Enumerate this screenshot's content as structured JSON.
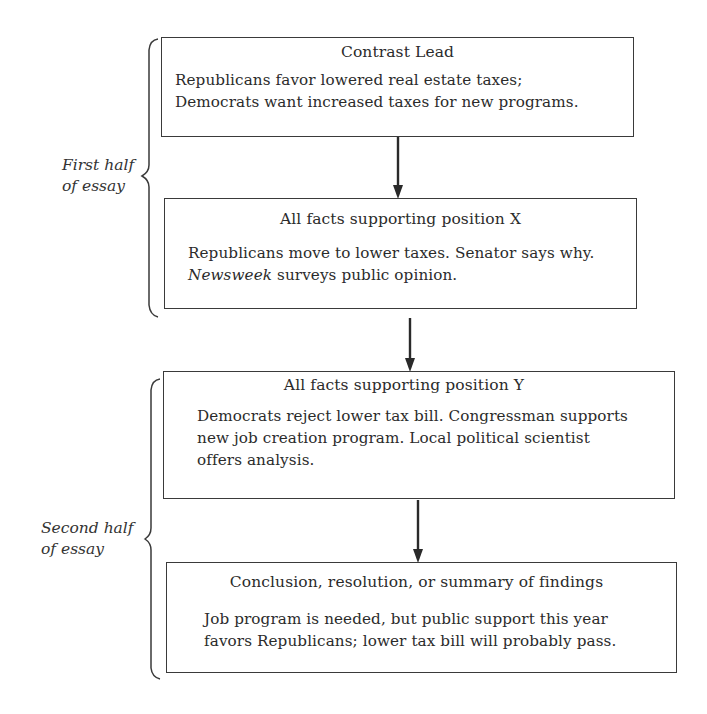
{
  "diagram": {
    "type": "essay-structure-flowchart",
    "sections": [
      {
        "label_line1": "First half",
        "label_line2": "of essay"
      },
      {
        "label_line1": "Second half",
        "label_line2": "of essay"
      }
    ],
    "boxes": [
      {
        "title": "Contrast Lead",
        "body_lines": [
          "Republicans favor lowered real estate taxes;",
          "Democrats want increased taxes for new programs."
        ]
      },
      {
        "title": "All facts supporting position X",
        "body_line1": "Republicans move to lower taxes.  Senator says why.",
        "body_line2_italic": "Newsweek",
        "body_line2_rest": " surveys public opinion."
      },
      {
        "title": "All facts supporting position Y",
        "body_lines": [
          "Democrats reject lower tax bill.  Congressman supports",
          "new job creation program.  Local political scientist",
          "offers analysis."
        ]
      },
      {
        "title": "Conclusion, resolution, or summary of findings",
        "body_lines": [
          "Job program is needed, but public support this year",
          "favors Republicans;  lower tax bill will probably pass."
        ]
      }
    ],
    "arrows": [
      {
        "from": "Contrast Lead",
        "to": "All facts supporting position X"
      },
      {
        "from": "All facts supporting position X",
        "to": "All facts supporting position Y"
      },
      {
        "from": "All facts supporting position Y",
        "to": "Conclusion, resolution, or summary of findings"
      }
    ],
    "colors": {
      "line": "#3a3a3a",
      "text": "#2b2b2b",
      "background": "#ffffff"
    }
  }
}
